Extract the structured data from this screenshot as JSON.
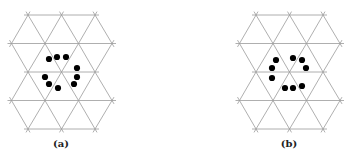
{
  "figure": {
    "panels": [
      {
        "id": "a",
        "label": "(a)",
        "offset_x": 0,
        "dots": [
          [
            49,
            59
          ],
          [
            57,
            57
          ],
          [
            66,
            57
          ],
          [
            77,
            68
          ],
          [
            45,
            77
          ],
          [
            77,
            77
          ],
          [
            49,
            84
          ],
          [
            58,
            88
          ],
          [
            74,
            84
          ]
        ]
      },
      {
        "id": "b",
        "label": "(b)",
        "offset_x": 228,
        "dots": [
          [
            276,
            60
          ],
          [
            272,
            68
          ],
          [
            272,
            78
          ],
          [
            293,
            58
          ],
          [
            302,
            60
          ],
          [
            306,
            68
          ],
          [
            285,
            88
          ],
          [
            293,
            88
          ],
          [
            302,
            86
          ]
        ]
      }
    ],
    "lattice": {
      "type": "triangular",
      "dx": 33.5,
      "row_y": [
        15,
        43.5,
        72,
        100.5,
        129
      ],
      "line_color": "#9a9a9a",
      "dot_color": "#000000"
    }
  }
}
